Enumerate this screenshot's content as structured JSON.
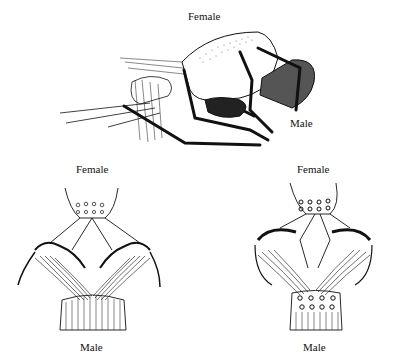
{
  "figure": {
    "top": {
      "label_female": "Female",
      "label_male": "Male"
    },
    "bottom_left": {
      "label_female": "Female",
      "label_male": "Male"
    },
    "bottom_right": {
      "label_female": "Female",
      "label_male": "Male"
    }
  },
  "colors": {
    "ink": "#111111",
    "background": "#ffffff"
  }
}
